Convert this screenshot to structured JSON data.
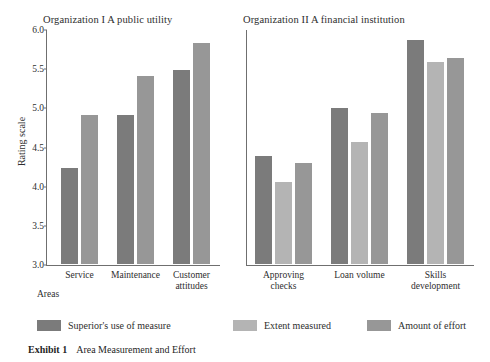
{
  "caption": {
    "label": "Exhibit 1",
    "text": "Area Measurement and Effort"
  },
  "axis": {
    "ylabel": "Rating scale",
    "xlabel_left": "Areas",
    "xlabel_right": "Areas",
    "yticks": [
      "3.0",
      "3.5",
      "4.0",
      "4.5",
      "5.0",
      "5.5",
      "6.0"
    ]
  },
  "legend": [
    {
      "label": "Superior's use of measure",
      "color": "#7b7b7b"
    },
    {
      "label": "Extent measured",
      "color": "#b4b4b4"
    },
    {
      "label": "Amount of effort",
      "color": "#979797"
    }
  ],
  "chart_data": [
    {
      "type": "bar",
      "title": "Organization I  A public utility",
      "categories": [
        "Service",
        "Maintenance",
        "Customer attitudes"
      ],
      "series": [
        {
          "name": "Superior's use of measure",
          "values": [
            4.25,
            4.93,
            5.5
          ]
        },
        {
          "name": "Amount of effort",
          "values": [
            4.93,
            5.43,
            5.85
          ]
        }
      ],
      "xlabel": "Areas",
      "ylabel": "Rating scale",
      "ylim": [
        3.0,
        6.0
      ],
      "grid": false,
      "legend_position": "bottom"
    },
    {
      "type": "bar",
      "title": "Organization II  A financial institution",
      "categories": [
        "Approving checks",
        "Loan volume",
        "Skills development"
      ],
      "series": [
        {
          "name": "Superior's use of measure",
          "values": [
            4.4,
            5.02,
            5.88
          ]
        },
        {
          "name": "Extent measured",
          "values": [
            4.07,
            4.58,
            5.6
          ]
        },
        {
          "name": "Amount of effort",
          "values": [
            4.32,
            4.95,
            5.65
          ]
        }
      ],
      "xlabel": "Areas",
      "ylabel": "Rating scale",
      "ylim": [
        3.0,
        6.0
      ],
      "grid": false,
      "legend_position": "bottom"
    }
  ]
}
